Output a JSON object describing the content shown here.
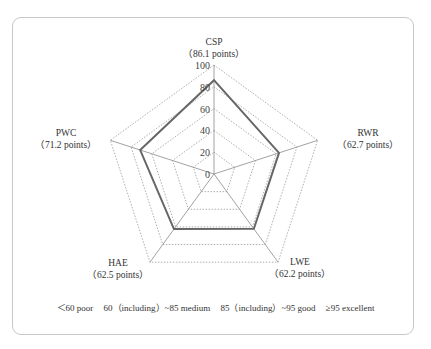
{
  "chart_data": {
    "type": "radar",
    "title": "",
    "axes": [
      {
        "name": "CSP",
        "value": 86.1,
        "label": "（86.1 points）"
      },
      {
        "name": "RWR",
        "value": 62.7,
        "label": "（62.7 points）"
      },
      {
        "name": "LWE",
        "value": 62.2,
        "label": "（62.2 points）"
      },
      {
        "name": "HAE",
        "value": 62.5,
        "label": "（62.5 points）"
      },
      {
        "name": "PWC",
        "value": 71.2,
        "label": "（71.2 points）"
      }
    ],
    "radial_ticks": [
      "0",
      "20",
      "40",
      "60",
      "80",
      "100"
    ],
    "range": [
      0,
      100
    ],
    "grid": "dotted pentagons",
    "series": [
      {
        "name": "score",
        "values": [
          86.1,
          62.7,
          62.2,
          62.5,
          71.2
        ],
        "color": "#666666"
      }
    ],
    "legend": [
      "<60 poor",
      "60（including）~85 medium",
      "85（including）~95 good",
      "≥95 excellent"
    ]
  },
  "labels": {
    "csp": {
      "name": "CSP",
      "points": "（86.1 points）"
    },
    "rwr": {
      "name": "RWR",
      "points": "（62.7 points）"
    },
    "lwe": {
      "name": "LWE",
      "points": "（62.2 points）"
    },
    "hae": {
      "name": "HAE",
      "points": "（62.5 points）"
    },
    "pwc": {
      "name": "PWC",
      "points": "（71.2 points）"
    }
  },
  "ticks": [
    "0",
    "20",
    "40",
    "60",
    "80",
    "100"
  ],
  "legend": {
    "poor": "＜60 poor",
    "medium": "60（including）~85 medium",
    "good": "85（including）~95 good",
    "excellent": "≥95 excellent"
  }
}
